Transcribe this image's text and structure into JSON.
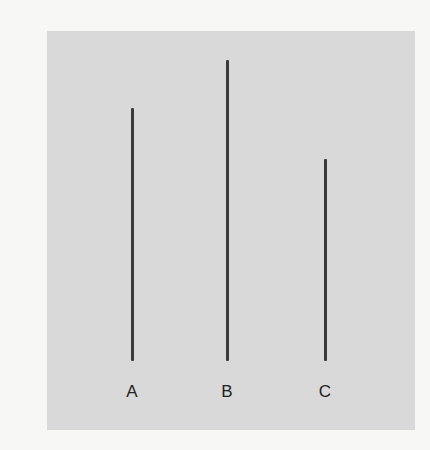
{
  "figure": {
    "colors": {
      "page_background": "#f7f7f5",
      "panel_background": "#d9d9d9",
      "line_color": "#3a3a3a",
      "label_color": "#222222"
    },
    "lines": [
      {
        "label": "A",
        "relative_length": 0.84
      },
      {
        "label": "B",
        "relative_length": 1.0
      },
      {
        "label": "C",
        "relative_length": 0.67
      }
    ]
  }
}
